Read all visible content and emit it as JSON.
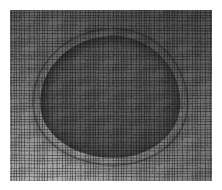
{
  "image": {
    "kind": "mesh-visualization",
    "title": "",
    "caption": "",
    "width": 222,
    "height": 190,
    "colorspace": "grayscale",
    "margin_color": "#ffffff",
    "margin_px": 10
  },
  "plate": {
    "x": 10,
    "y": 10,
    "width": 202,
    "height": 171,
    "background_color": "#6e6e6e"
  },
  "field": {
    "name": "background-mesh-field",
    "description": "structured quadrilateral grid filling the frame",
    "light_color": "#b4b4b4",
    "mid_color": "#8e8e8e",
    "dark_color": "#676767",
    "highlight_corner": "bottom-left",
    "shadow_corner": "top-right",
    "grid_line_color": "#141414",
    "grid_spacing_px": 2.55
  },
  "blob": {
    "name": "dark-inclusion-region",
    "description": "rounded blob occupying the centre of the mesh",
    "x": 30,
    "y": 26,
    "width": 140,
    "height": 122,
    "rotation_deg": -3,
    "fill_light": "#585858",
    "fill_dark": "#434343",
    "rim_color": "#191919",
    "halo_color": "#3c3c3c"
  },
  "mesh": {
    "name": "quad-mesh-overlay",
    "primary_spacing_px": 2.55,
    "secondary_spacing_px": 3.1,
    "line_color": "#141414",
    "highlight_color": "#ffffff",
    "refinement_ring": true
  },
  "colors": {
    "white": "#ffffff",
    "lightest_gray": "#b4b4b4",
    "mid_gray": "#8e8e8e",
    "base_gray": "#6e6e6e",
    "blob_gray": "#4b4b4b",
    "line_black": "#141414"
  }
}
